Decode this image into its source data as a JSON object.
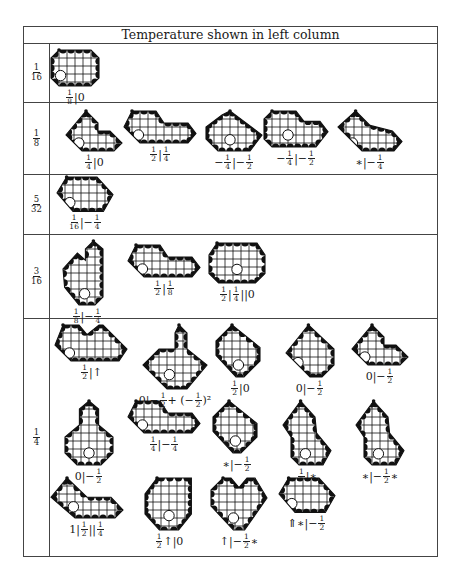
{
  "table": {
    "header": "Temperature shown in left column",
    "rows": [
      {
        "temperature": {
          "num": "1",
          "den": "16"
        },
        "positions": [
          {
            "label": [
              {
                "f": [
                  "1",
                  "8"
                ]
              },
              {
                "t": "|0"
              }
            ],
            "shape": "oct-wide"
          }
        ]
      },
      {
        "temperature": {
          "num": "1",
          "den": "8"
        },
        "positions": [
          {
            "label": [
              {
                "f": [
                  "1",
                  "4"
                ]
              },
              {
                "t": "|0"
              }
            ],
            "shape": "diamond-l"
          },
          {
            "label": [
              {
                "f": [
                  "1",
                  "2"
                ]
              },
              {
                "t": "|"
              },
              {
                "f": [
                  "1",
                  "4"
                ]
              }
            ],
            "shape": "long-l"
          },
          {
            "label": [
              {
                "t": "−"
              },
              {
                "f": [
                  "1",
                  "4"
                ]
              },
              {
                "t": "|−"
              },
              {
                "f": [
                  "1",
                  "2"
                ]
              }
            ],
            "shape": "oct-hole-l"
          },
          {
            "label": [
              {
                "t": "−"
              },
              {
                "f": [
                  "1",
                  "4"
                ]
              },
              {
                "t": "|−"
              },
              {
                "f": [
                  "1",
                  "2"
                ]
              }
            ],
            "shape": "oct-hole-long"
          },
          {
            "label": [
              {
                "t": "∗|−"
              },
              {
                "f": [
                  "1",
                  "4"
                ]
              }
            ],
            "shape": "diamond-long"
          }
        ]
      },
      {
        "temperature": {
          "num": "5",
          "den": "32"
        },
        "positions": [
          {
            "label": [
              {
                "f": [
                  "1",
                  "16"
                ]
              },
              {
                "t": "|−"
              },
              {
                "f": [
                  "1",
                  "4"
                ]
              }
            ],
            "shape": "hex-wide"
          }
        ]
      },
      {
        "temperature": {
          "num": "3",
          "den": "16"
        },
        "positions": [
          {
            "label": [
              {
                "f": [
                  "1",
                  "8"
                ]
              },
              {
                "t": "|−"
              },
              {
                "f": [
                  "1",
                  "4"
                ]
              }
            ],
            "shape": "tall-l-hole"
          },
          {
            "label": [
              {
                "f": [
                  "1",
                  "2"
                ]
              },
              {
                "t": "|"
              },
              {
                "f": [
                  "1",
                  "8"
                ]
              }
            ],
            "shape": "long-l"
          },
          {
            "label": [
              {
                "f": [
                  "1",
                  "2"
                ]
              },
              {
                "t": "|"
              },
              {
                "f": [
                  "1",
                  "4"
                ]
              },
              {
                "t": "||0"
              }
            ],
            "shape": "oct-hole-wide"
          }
        ]
      },
      {
        "temperature": {
          "num": "1",
          "den": "4"
        },
        "positions": [
          {
            "label": [
              {
                "f": [
                  "1",
                  "2"
                ]
              },
              {
                "t": "|↑"
              }
            ],
            "shape": "notch-wide"
          },
          {
            "label": [
              {
                "t": "0|−"
              },
              {
                "f": [
                  "1",
                  "2"
                ]
              },
              {
                "t": " + (−"
              },
              {
                "f": [
                  "1",
                  "2"
                ]
              },
              {
                "t": ")²"
              }
            ],
            "shape": "big-l-hole"
          },
          {
            "label": [
              {
                "f": [
                  "1",
                  "2"
                ]
              },
              {
                "t": "|0"
              }
            ],
            "shape": "diamond-hole"
          },
          {
            "label": [
              {
                "t": "0|−"
              },
              {
                "f": [
                  "1",
                  "2"
                ]
              }
            ],
            "shape": "diamond-right"
          },
          {
            "label": [
              {
                "t": "0|−"
              },
              {
                "f": [
                  "1",
                  "2"
                ]
              }
            ],
            "shape": "diamond-l"
          },
          {
            "label": [
              {
                "t": "0|−"
              },
              {
                "f": [
                  "1",
                  "2"
                ]
              }
            ],
            "shape": "bell-hole"
          },
          {
            "label": [
              {
                "f": [
                  "1",
                  "4"
                ]
              },
              {
                "t": "|−"
              },
              {
                "f": [
                  "1",
                  "4"
                ]
              }
            ],
            "shape": "long-l"
          },
          {
            "label": [
              {
                "t": "∗|−"
              },
              {
                "f": [
                  "1",
                  "2"
                ]
              }
            ],
            "shape": "diamond-hole"
          },
          {
            "label": [
              {
                "f": [
                  "1",
                  "2"
                ]
              },
              {
                "t": "|∗"
              }
            ],
            "shape": "tall-hole"
          },
          {
            "label": [
              {
                "t": "∗|−"
              },
              {
                "f": [
                  "1",
                  "2"
                ]
              },
              {
                "t": "∗"
              }
            ],
            "shape": "tall-hole"
          },
          {
            "label": [
              {
                "t": "1|"
              },
              {
                "f": [
                  "1",
                  "2"
                ]
              },
              {
                "t": "||"
              },
              {
                "f": [
                  "1",
                  "4"
                ]
              }
            ],
            "shape": "long-l-hole"
          },
          {
            "label": [
              {
                "f": [
                  "1",
                  "2"
                ]
              },
              {
                "t": "↑|0"
              }
            ],
            "shape": "oct-hole-tall"
          },
          {
            "label": [
              {
                "t": "↑|−"
              },
              {
                "f": [
                  "1",
                  "2"
                ]
              },
              {
                "t": "∗"
              }
            ],
            "shape": "notch-hole"
          },
          {
            "label": [
              {
                "t": "⇑∗|−"
              },
              {
                "f": [
                  "1",
                  "2"
                ]
              }
            ],
            "shape": "hex-wide"
          }
        ]
      }
    ]
  },
  "colors": {
    "ink": "#111111",
    "border": "#444444",
    "background": "#ffffff"
  }
}
